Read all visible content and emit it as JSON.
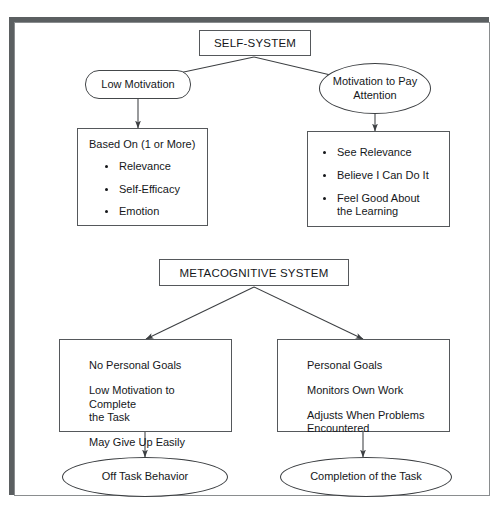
{
  "diagram": {
    "nodes": {
      "self_system": {
        "label": "SELF-SYSTEM",
        "shape": "rectangle"
      },
      "low_motivation": {
        "label": "Low Motivation",
        "shape": "stadium"
      },
      "motivation_to_pay_attention": {
        "label": "Motivation to Pay\nAttention",
        "line1": "Motivation to Pay",
        "line2": "Attention",
        "shape": "ellipse"
      },
      "based_on": {
        "shape": "rectangle",
        "heading": "Based On (1 or More)",
        "bullets": [
          "Relevance",
          "Self-Efficacy",
          "Emotion"
        ]
      },
      "positive_outcomes": {
        "shape": "rectangle",
        "bullets": [
          "See Relevance",
          "Believe I Can Do It",
          "Feel Good About\nthe Learning"
        ],
        "bullet3_line1": "Feel Good About",
        "bullet3_line2": "the Learning"
      },
      "metacognitive_system": {
        "label": "METACOGNITIVE SYSTEM",
        "shape": "rectangle"
      },
      "no_personal_goals": {
        "shape": "rectangle",
        "lines": [
          "No Personal Goals",
          "Low Motivation to Complete\nthe Task",
          "May Give Up Easily"
        ],
        "line1": "No Personal Goals",
        "line2a": "Low Motivation to Complete",
        "line2b": "the Task",
        "line3": "May Give Up Easily"
      },
      "personal_goals": {
        "shape": "rectangle",
        "lines": [
          "Personal Goals",
          "Monitors Own Work",
          "Adjusts When Problems\nEncountered"
        ],
        "line1": "Personal Goals",
        "line2": "Monitors Own Work",
        "line3a": "Adjusts When Problems",
        "line3b": "Encountered"
      },
      "off_task_behavior": {
        "label": "Off Task Behavior",
        "shape": "ellipse"
      },
      "completion_of_task": {
        "label": "Completion of the Task",
        "shape": "ellipse"
      }
    },
    "edges": [
      {
        "from": "self_system",
        "to": "low_motivation",
        "style": "arrow"
      },
      {
        "from": "self_system",
        "to": "motivation_to_pay_attention",
        "style": "arrow"
      },
      {
        "from": "low_motivation",
        "to": "based_on",
        "style": "arrow"
      },
      {
        "from": "motivation_to_pay_attention",
        "to": "positive_outcomes",
        "style": "arrow"
      },
      {
        "from": "metacognitive_system",
        "to": "no_personal_goals",
        "style": "arrow"
      },
      {
        "from": "metacognitive_system",
        "to": "personal_goals",
        "style": "arrow"
      },
      {
        "from": "no_personal_goals",
        "to": "off_task_behavior",
        "style": "arrow"
      },
      {
        "from": "personal_goals",
        "to": "completion_of_task",
        "style": "arrow"
      }
    ],
    "colors": {
      "page_background": "#ffffff",
      "frame_shadow": "#5b5f61",
      "frame_border": "#8a8d8f",
      "node_stroke": "#55585b",
      "text": "#15171a",
      "edge_stroke": "#3c3f42"
    }
  }
}
